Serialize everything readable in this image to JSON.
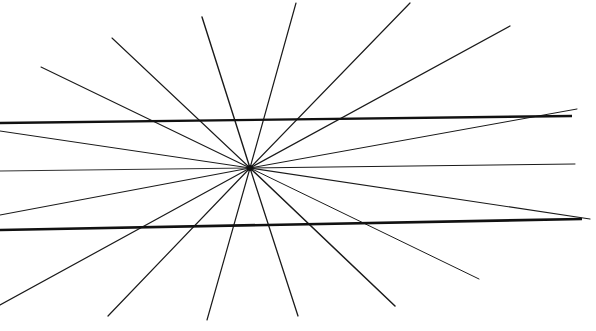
{
  "figure": {
    "background": "#ffffff",
    "line_color": "#1a1a1a",
    "center": {
      "x": 250,
      "y": 168
    },
    "rays": [
      {
        "x": 41,
        "y": 67,
        "w": 1.1
      },
      {
        "x": 112,
        "y": 38,
        "w": 1.1
      },
      {
        "x": 202,
        "y": 17,
        "w": 1.4
      },
      {
        "x": 296,
        "y": 3,
        "w": 1.2
      },
      {
        "x": 410,
        "y": 3,
        "w": 1.2
      },
      {
        "x": 510,
        "y": 26,
        "w": 1.3
      },
      {
        "x": 577,
        "y": 109,
        "w": 1.0
      },
      {
        "x": 575,
        "y": 164,
        "w": 1.0
      },
      {
        "x": 590,
        "y": 219,
        "w": 1.2
      },
      {
        "x": 479,
        "y": 279,
        "w": 1.0
      },
      {
        "x": 395,
        "y": 306,
        "w": 1.5
      },
      {
        "x": 298,
        "y": 316,
        "w": 1.3
      },
      {
        "x": 207,
        "y": 320,
        "w": 1.2
      },
      {
        "x": 108,
        "y": 316,
        "w": 1.2
      },
      {
        "x": 0,
        "y": 305,
        "w": 1.2
      },
      {
        "x": 0,
        "y": 215,
        "w": 1.2
      },
      {
        "x": 0,
        "y": 171,
        "w": 0.9
      },
      {
        "x": 0,
        "y": 131,
        "w": 1.0
      }
    ],
    "horizontal_lines": [
      {
        "x1": 0,
        "y1": 123,
        "x2": 572,
        "y2": 116,
        "w": 2.4
      },
      {
        "x1": 0,
        "y1": 230,
        "x2": 582,
        "y2": 219,
        "w": 2.6
      }
    ]
  }
}
